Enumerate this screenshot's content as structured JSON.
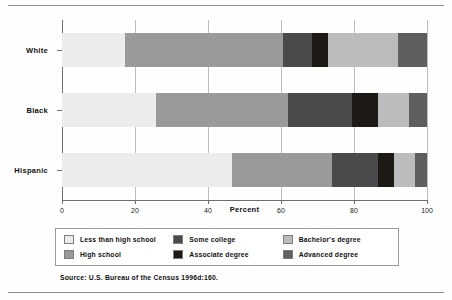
{
  "chart_data": {
    "type": "bar",
    "orientation": "horizontal",
    "stacked": true,
    "percent_stacked": true,
    "title": "",
    "xlabel": "Percent",
    "ylabel": "",
    "xlim": [
      0,
      100
    ],
    "xticks": [
      0,
      20,
      40,
      60,
      80,
      100
    ],
    "xtick_labels": [
      "0",
      "20",
      "40",
      "60",
      "80",
      "100"
    ],
    "grid": true,
    "grid_axis": "x",
    "legend_position": "bottom",
    "categories": [
      "White",
      "Black",
      "Hispanic"
    ],
    "series": [
      {
        "name": "Less than high school",
        "values": [
          17.3,
          25.8,
          46.6
        ]
      },
      {
        "name": "High school",
        "values": [
          43.2,
          36.2,
          27.4
        ]
      },
      {
        "name": "Some college",
        "values": [
          8.0,
          17.5,
          12.5
        ]
      },
      {
        "name": "Associate degree",
        "values": [
          4.5,
          7.1,
          4.5
        ]
      },
      {
        "name": "Bachelor's degree",
        "values": [
          19.0,
          8.4,
          5.7
        ]
      },
      {
        "name": "Advanced degree",
        "values": [
          8.0,
          5.0,
          3.3
        ]
      }
    ]
  },
  "legend": {
    "items": [
      {
        "label": "Less than high school",
        "swatch": "p-less"
      },
      {
        "label": "High school",
        "swatch": "p-hs"
      },
      {
        "label": "Some college",
        "swatch": "p-some"
      },
      {
        "label": "Associate degree",
        "swatch": "p-assoc"
      },
      {
        "label": "Bachelor's degree",
        "swatch": "p-bach"
      },
      {
        "label": "Advanced degree",
        "swatch": "p-adv"
      }
    ]
  },
  "source": {
    "text": "Source: U.S. Bureau of the Census 1996d:160."
  },
  "colors": {
    "less_than_high_school": "#ececed",
    "high_school": "#9a9a9c",
    "some_college": "#4a4a4c",
    "associate_degree": "#1d1a15",
    "bachelors_degree": "#bcbcbe",
    "advanced_degree": "#5f5f62",
    "axis": "#6e6e6e",
    "grid": "#bdbdbd",
    "text": "#111111"
  }
}
